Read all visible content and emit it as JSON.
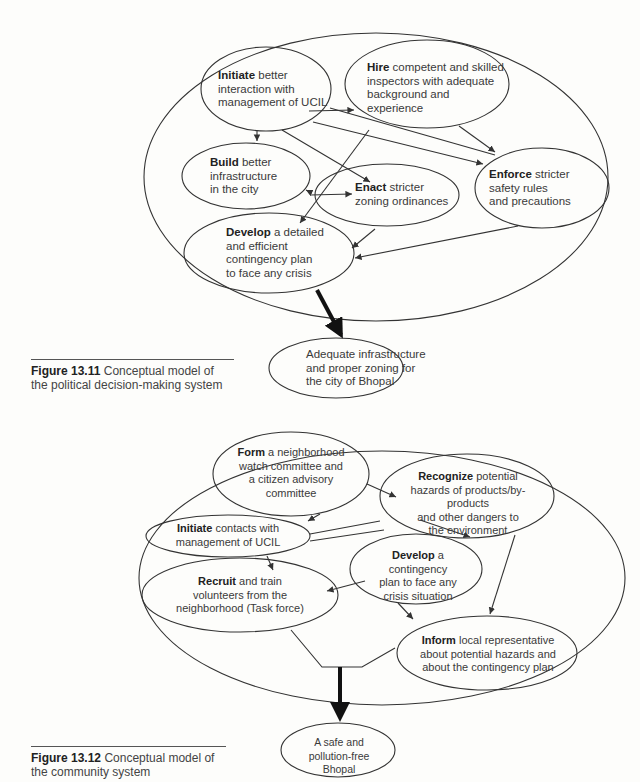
{
  "figure_13_11": {
    "caption_label": "Figure 13.11",
    "caption_text_1": "Conceptual model of",
    "caption_text_2": "the political decision-making system",
    "nodes": {
      "initiate": {
        "bold": "Initiate",
        "l1": " better",
        "l2": "interaction with",
        "l3": "management of UCIL"
      },
      "hire": {
        "bold": "Hire",
        "l1": " competent and skilled",
        "l2": "inspectors with adequate",
        "l3": "background and",
        "l4": "experience"
      },
      "build": {
        "bold": "Build",
        "l1": " better",
        "l2": "infrastructure",
        "l3": "in the city"
      },
      "enact": {
        "bold": "Enact",
        "l1": " stricter",
        "l2": "zoning ordinances"
      },
      "enforce": {
        "bold": "Enforce",
        "l1": " stricter",
        "l2": "safety rules",
        "l3": "and precautions"
      },
      "develop": {
        "bold": "Develop",
        "l1": " a detailed",
        "l2": "and efficient",
        "l3": "contingency plan",
        "l4": "to face any crisis"
      },
      "outcome": {
        "l1": "Adequate infrastructure",
        "l2": "and proper zoning for",
        "l3": "the city of Bhopal"
      }
    }
  },
  "figure_13_12": {
    "caption_label": "Figure 13.12",
    "caption_text_1": "Conceptual model of",
    "caption_text_2": "the community system",
    "nodes": {
      "form": {
        "bold": "Form",
        "l1": " a neighborhood",
        "l2": "watch committee and",
        "l3": "a citizen advisory",
        "l4": "committee"
      },
      "recognize": {
        "bold": "Recognize",
        "l1": " potential",
        "l2": "hazards of products/by-products",
        "l3": "and other dangers to",
        "l4": "the environment"
      },
      "initiate": {
        "bold": "Initiate",
        "l1": " contacts with",
        "l2": "management of UCIL"
      },
      "develop": {
        "bold": "Develop",
        "l1": " a contingency",
        "l2": "plan to face any",
        "l3": "crisis situation"
      },
      "recruit": {
        "bold": "Recruit",
        "l1": " and train",
        "l2": "volunteers from the",
        "l3": "neighborhood (Task force)"
      },
      "inform": {
        "bold": "Inform",
        "l1": " local representative",
        "l2": "about potential hazards and",
        "l3": "about the contingency plan"
      },
      "outcome": {
        "l1": "A safe and",
        "l2": "pollution-free Bhopal"
      }
    }
  }
}
